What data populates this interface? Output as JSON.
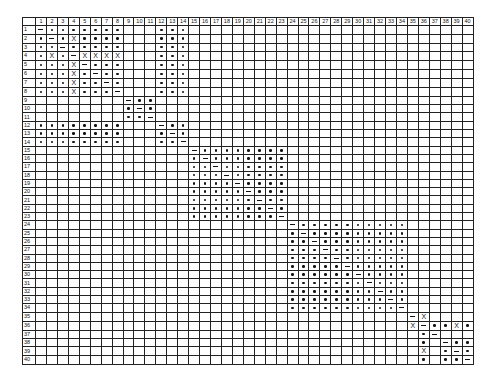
{
  "grid": {
    "size": 40,
    "column_headers": [
      "1",
      "2",
      "3",
      "4",
      "5",
      "6",
      "7",
      "8",
      "9",
      "10",
      "11",
      "12",
      "13",
      "14",
      "15",
      "16",
      "17",
      "18",
      "19",
      "20",
      "21",
      "22",
      "23",
      "24",
      "25",
      "26",
      "27",
      "28",
      "29",
      "30",
      "31",
      "32",
      "33",
      "34",
      "35",
      "36",
      "37",
      "38",
      "39",
      "40"
    ],
    "row_headers": [
      "1",
      "2",
      "3",
      "4",
      "5",
      "6",
      "7",
      "8",
      "9",
      "10",
      "11",
      "12",
      "13",
      "14",
      "15",
      "16",
      "17",
      "18",
      "19",
      "20",
      "21",
      "22",
      "23",
      "24",
      "25",
      "26",
      "27",
      "28",
      "29",
      "30",
      "31",
      "32",
      "33",
      "34",
      "35",
      "36",
      "37",
      "38",
      "39",
      "40"
    ],
    "legend": {
      "o": "dot",
      "-": "dash",
      "X": "cross",
      ".": "empty"
    },
    "rows": [
      "-ooooooo...ooo..........................",
      "o-oXoooo...ooo..........................",
      "oo-ooooo...ooo..........................",
      "oXo-XXXX...ooo..........................",
      "oooX-ooo...ooo..........................",
      "oooXo-oo...ooo..........................",
      "oooXoo-o...ooo..........................",
      "oooXooo-...ooo..........................",
      "........-oo.............................",
      "........o-o.............................",
      "........oo-.............................",
      "oooooooo...-oo..........................",
      "oooooooo...o-o..........................",
      "oooooooo...oo-..........................",
      "..............-oooooooo.................",
      "..............o-ooooooo.................",
      "..............oo-oooooo.................",
      "..............ooo-ooooo.................",
      "..............oooo-oooo.................",
      "..............ooooo-ooo.................",
      "..............oooooo-oo.................",
      "..............ooooooo-o.................",
      "..............oooooooo-.................",
      ".......................-oooooooooo......",
      ".......................o-ooooooooo......",
      ".......................oo-oooooooo......",
      ".......................ooo-ooooooo......",
      ".......................oooo-oooooo......",
      ".......................ooooo-ooooo......",
      ".......................oooooo-oooo......",
      ".......................ooooooo-ooo......",
      ".......................oooooooo-oo......",
      ".......................ooooooooo-o......",
      ".......................oooooooooo-......",
      "..................................-X....",
      "..................................X-ooXo",
      "...................................o-...",
      "...................................o.-oo",
      "...................................X.o-o",
      "...................................o.oo-"
    ]
  }
}
